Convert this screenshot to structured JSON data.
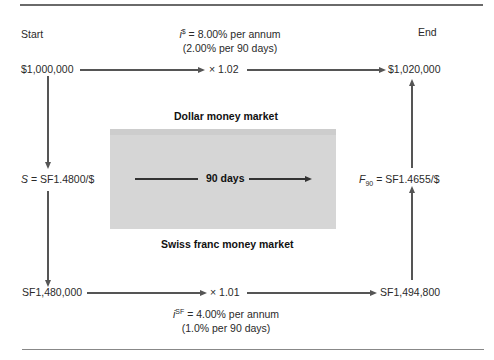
{
  "diagram": {
    "labels": {
      "start": "Start",
      "end": "End"
    },
    "dollar_market": {
      "title": "Dollar money market",
      "rate_symbol": "i",
      "rate_superscript": "$",
      "rate_annual": " = 8.00% per annum",
      "rate_period": "(2.00% per 90 days)",
      "multiplier": "× 1.02",
      "start_amount": "$1,000,000",
      "end_amount": "$1,020,000"
    },
    "swiss_market": {
      "title": "Swiss franc money market",
      "rate_symbol": "i",
      "rate_superscript": "SF",
      "rate_annual": " = 4.00% per annum",
      "rate_period": "(1.0% per 90 days)",
      "multiplier": "× 1.01",
      "start_amount": "SF1,480,000",
      "end_amount": "SF1,494,800"
    },
    "spot_rate": {
      "symbol": "S",
      "value": " = SF1.4800/$"
    },
    "forward_rate": {
      "symbol": "F",
      "subscript": "90",
      "value": " = SF1.4655/$"
    },
    "period": {
      "label": "90 days"
    },
    "colors": {
      "arrow": "#555555",
      "box_fill": "#d6d6d6",
      "rule": "#6a6a6a",
      "text": "#2a2a2a"
    }
  }
}
